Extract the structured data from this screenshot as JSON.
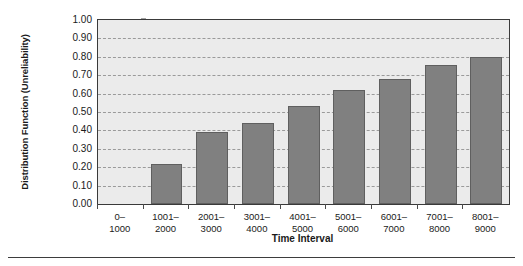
{
  "chart_data": {
    "type": "bar",
    "title": "",
    "xlabel": "Time Interval",
    "ylabel": "Distribution Function (Unreliability)",
    "categories": [
      "0–\n1000",
      "1001–\n2000",
      "2001–\n3000",
      "3001–\n4000",
      "4001–\n5000",
      "5001–\n6000",
      "6001–\n7000",
      "7001–\n8000",
      "8001–\n9000"
    ],
    "category_lines": [
      [
        "0–",
        "1000"
      ],
      [
        "1001–",
        "2000"
      ],
      [
        "2001–",
        "3000"
      ],
      [
        "3001–",
        "4000"
      ],
      [
        "4001–",
        "5000"
      ],
      [
        "5001–",
        "6000"
      ],
      [
        "6001–",
        "7000"
      ],
      [
        "7001–",
        "8000"
      ],
      [
        "8001–",
        "9000"
      ]
    ],
    "values": [
      0.0,
      0.22,
      0.39,
      0.44,
      0.53,
      0.62,
      0.68,
      0.755,
      0.8
    ],
    "ylim": [
      0.0,
      1.0
    ],
    "ytick_labels": [
      "1.00",
      "0.90",
      "0.80",
      "0.70",
      "0.60",
      "0.50",
      "0.40",
      "0.30",
      "0.20",
      "0.10",
      "0.00"
    ],
    "ytick_values": [
      1.0,
      0.9,
      0.8,
      0.7,
      0.6,
      0.5,
      0.4,
      0.3,
      0.2,
      0.1,
      0.0
    ],
    "grid": true,
    "legend": "none",
    "colors": {
      "bar_fill": "#808080",
      "bar_edge": "#5f5f5f",
      "plot_background": "#ebebeb",
      "plot_border": "#3a3a3a",
      "gridline": "#9a9a9a",
      "text": "#1a1a1a"
    }
  }
}
